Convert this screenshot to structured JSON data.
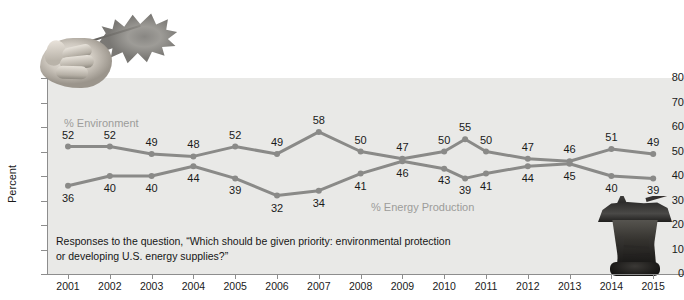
{
  "chart_data": {
    "type": "line",
    "title": "",
    "xlabel": "",
    "ylabel": "Percent",
    "ylim": [
      0,
      80
    ],
    "ytick_step": 10,
    "yticks": [
      0,
      10,
      20,
      30,
      40,
      50,
      60,
      70,
      80
    ],
    "grid": false,
    "legend_position": "inline-labels",
    "categories": [
      "2001",
      "2002",
      "2003",
      "2004",
      "2005",
      "2006",
      "2007",
      "2008",
      "2009",
      "2010",
      "2010b",
      "2011",
      "2012",
      "2013",
      "2014",
      "2015"
    ],
    "tick_labels": [
      "2001",
      "2002",
      "2003",
      "2004",
      "2005",
      "2006",
      "2007",
      "2008",
      "2009",
      "2010",
      "2011",
      "2012",
      "2013",
      "2014",
      "2015"
    ],
    "series": [
      {
        "name": "% Environment",
        "color": "#8a8a88",
        "values": [
          52,
          52,
          49,
          48,
          52,
          49,
          58,
          50,
          47,
          50,
          55,
          50,
          47,
          46,
          51,
          49
        ]
      },
      {
        "name": "% Energy Production",
        "color": "#8a8a88",
        "values": [
          36,
          40,
          40,
          44,
          39,
          32,
          34,
          41,
          46,
          43,
          39,
          41,
          44,
          45,
          40,
          39
        ]
      }
    ],
    "annotations": [
      "Responses to the question, “Which should be given priority: environmental protection or developing U.S. energy supplies?”"
    ]
  },
  "labels": {
    "series_environment": "% Environment",
    "series_energy": "% Energy Production",
    "y_axis_title": "Percent"
  },
  "caption": {
    "line1": "Responses to the question, “Which should be given priority: environmental protection or",
    "line2": "developing U.S. energy supplies?”"
  },
  "images": {
    "top_left": "hand-holding-oak-leaf-photo",
    "bottom_right": "offshore-oil-rig-photo"
  },
  "colors": {
    "plot_background": "#e9e9e7",
    "line": "#8a8a88",
    "axis": "#8d8d8d",
    "text": "#1a1a1a",
    "series_label": "#9c9c9a"
  }
}
